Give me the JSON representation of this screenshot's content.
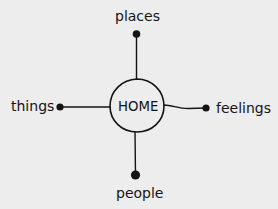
{
  "diagram": {
    "type": "mind-map",
    "center": {
      "label": "HOME"
    },
    "branches": [
      {
        "id": "top",
        "label": "places",
        "direction": "up"
      },
      {
        "id": "left",
        "label": "things",
        "direction": "left"
      },
      {
        "id": "right",
        "label": "feelings",
        "direction": "right"
      },
      {
        "id": "bottom",
        "label": "people",
        "direction": "down"
      }
    ],
    "colors": {
      "background": "#ededed",
      "ink": "#141414"
    }
  }
}
